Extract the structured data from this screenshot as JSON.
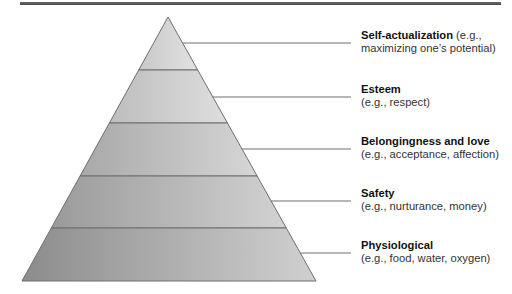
{
  "diagram": {
    "type": "pyramid",
    "levels": [
      {
        "title": "Self-actualization",
        "desc_inline": " (e.g.,",
        "desc": "maximizing one’s potential)"
      },
      {
        "title": "Esteem",
        "desc_inline": "",
        "desc": "(e.g., respect)"
      },
      {
        "title": "Belongingness and love",
        "desc_inline": "",
        "desc": "(e.g., acceptance, affection)"
      },
      {
        "title": "Safety",
        "desc_inline": "",
        "desc": "(e.g., nurturance, money)"
      },
      {
        "title": "Physiological",
        "desc_inline": "",
        "desc": "(e.g., food, water, oxygen)"
      }
    ],
    "colors": {
      "outline": "#6e6e6e",
      "leader": "#6e6e6e",
      "fill_dark": "#8e8e8e",
      "fill_light": "#dcdcdc"
    }
  }
}
